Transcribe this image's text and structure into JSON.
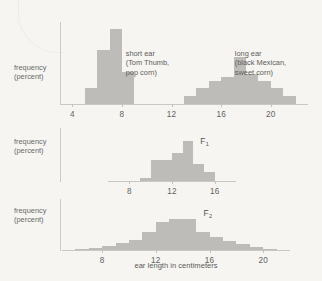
{
  "figure": {
    "axis_title": "ear length in centimeters",
    "y_label_line1": "frequency",
    "y_label_line2": "(percent)"
  },
  "chart_data": {
    "type": "bar",
    "title": "",
    "xlabel": "ear length in centimeters",
    "ylabel": "frequency (percent)",
    "grid": false,
    "legend": "none",
    "bin_width": 1,
    "panels": [
      {
        "name": "parental",
        "label": "",
        "xlim": [
          3,
          23
        ],
        "ticks": [
          4,
          8,
          12,
          16,
          20
        ],
        "tick_labels": [
          "4",
          "8",
          "12",
          "16",
          "20"
        ],
        "ylim": [
          0,
          45
        ],
        "annotations": [
          {
            "name": "short-ear",
            "lines": [
              "short ear",
              "(Tom Thumb,",
              "pop corn)"
            ],
            "x_pct": 26.5,
            "y_px": 27
          },
          {
            "name": "long-ear",
            "lines": [
              "long ear",
              "(black Mexican,",
              "sweet corn)"
            ],
            "x_pct": 70.5,
            "y_px": 27
          }
        ],
        "series": [
          {
            "name": "short ear (Tom Thumb, pop corn)",
            "x": [
              5,
              6,
              7,
              8
            ],
            "values": [
              9,
              30,
              41,
              18
            ]
          },
          {
            "name": "long ear (black Mexican, sweet corn)",
            "x": [
              13,
              14,
              15,
              16,
              17,
              18,
              19,
              20,
              21
            ],
            "values": [
              5,
              9,
              13,
              15,
              26,
              17,
              13,
              9,
              5
            ]
          }
        ]
      },
      {
        "name": "F1",
        "label": "F",
        "label_sub": "1",
        "xlim": [
          6,
          18
        ],
        "ticks": [
          8,
          12,
          16
        ],
        "tick_labels": [
          "8",
          "12",
          "16"
        ],
        "ylim": [
          0,
          45
        ],
        "annotations": [],
        "series": [
          {
            "name": "F1",
            "x": [
              9,
              10,
              11,
              12,
              13,
              14,
              15
            ],
            "values": [
              4,
              21,
              21,
              27,
              38,
              17,
              9
            ]
          }
        ]
      },
      {
        "name": "F2",
        "label": "F",
        "label_sub": "2",
        "xlim": [
          5,
          22
        ],
        "ticks": [
          8,
          12,
          16,
          20
        ],
        "tick_labels": [
          "8",
          "12",
          "16",
          "20"
        ],
        "ylim": [
          0,
          45
        ],
        "annotations": [],
        "series": [
          {
            "name": "F2",
            "x": [
              6,
              7,
              8,
              9,
              10,
              11,
              12,
              13,
              14,
              15,
              16,
              17,
              18,
              19,
              20
            ],
            "values": [
              2,
              3,
              5,
              8,
              12,
              20,
              30,
              34,
              33,
              20,
              15,
              11,
              7,
              4,
              2
            ]
          }
        ]
      }
    ]
  }
}
